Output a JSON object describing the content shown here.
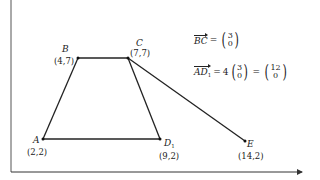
{
  "diagram": {
    "axes": {
      "origin_px": [
        11,
        172
      ],
      "x_axis_end_px": [
        305,
        172
      ],
      "y_axis_top_px": [
        11,
        0
      ],
      "line_color": "#333333"
    },
    "points": [
      {
        "id": "A",
        "name": "A",
        "sub": "",
        "coord": "(2,2)",
        "px": [
          43,
          139
        ]
      },
      {
        "id": "B",
        "name": "B",
        "sub": "",
        "coord": "(4,7)",
        "px": [
          78,
          58
        ]
      },
      {
        "id": "C",
        "name": "C",
        "sub": "",
        "coord": "(7,7)",
        "px": [
          128,
          58
        ]
      },
      {
        "id": "D1",
        "name": "D",
        "sub": "1",
        "coord": "(9,2)",
        "px": [
          160,
          139
        ]
      },
      {
        "id": "E",
        "name": "E",
        "sub": "",
        "coord": "(14,2)",
        "px": [
          245,
          141
        ]
      }
    ],
    "segments": [
      {
        "from": "A",
        "to": "B"
      },
      {
        "from": "B",
        "to": "C"
      },
      {
        "from": "C",
        "to": "D1"
      },
      {
        "from": "A",
        "to": "D1"
      },
      {
        "from": "C",
        "to": "E"
      }
    ],
    "equations": {
      "bc": {
        "vector": "BC",
        "equals": "=",
        "top": "3",
        "bottom": "0"
      },
      "ad1": {
        "vector": "AD",
        "vector_sub": "1",
        "equals": "=",
        "scalar": "4",
        "inner_top": "3",
        "inner_bottom": "0",
        "equals2": "=",
        "result_top": "12",
        "result_bottom": "0"
      }
    }
  }
}
